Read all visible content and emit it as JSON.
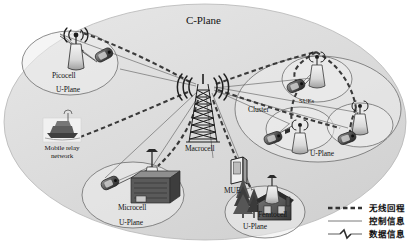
{
  "diagram": {
    "title": "C-Plane",
    "macrocell_label": "Macrocell",
    "mue_label": "MUE",
    "relay_label": "Mobile relay network",
    "cluster_label": "Cluster",
    "sue_label": "SUEs",
    "cells": [
      {
        "name": "picocell",
        "label": "Picocell",
        "plane": "U-Plane"
      },
      {
        "name": "microcell",
        "label": "Microcell",
        "plane": "U-Plane"
      },
      {
        "name": "femtocell",
        "label": "Femtocell",
        "plane": "U-Plane"
      },
      {
        "name": "cluster",
        "label": "Cluster",
        "plane": "U-Plane"
      }
    ],
    "colors": {
      "cplane_fill": "#dedede",
      "cell_fill": "#efefef",
      "stroke": "#4a4a4a",
      "dashed": "#3a3a3a",
      "control": "#6a6a6a",
      "icon_dark": "#3c3c3c",
      "icon_mid": "#8a8a8a",
      "icon_light": "#d4d4d4"
    }
  },
  "legend": {
    "items": [
      {
        "name": "wireless-backhaul",
        "style": "dashed",
        "label": "无线回程"
      },
      {
        "name": "control-information",
        "style": "solid",
        "label": "控制信息"
      },
      {
        "name": "data-information",
        "style": "zigzag",
        "label": "数据信息"
      }
    ]
  }
}
